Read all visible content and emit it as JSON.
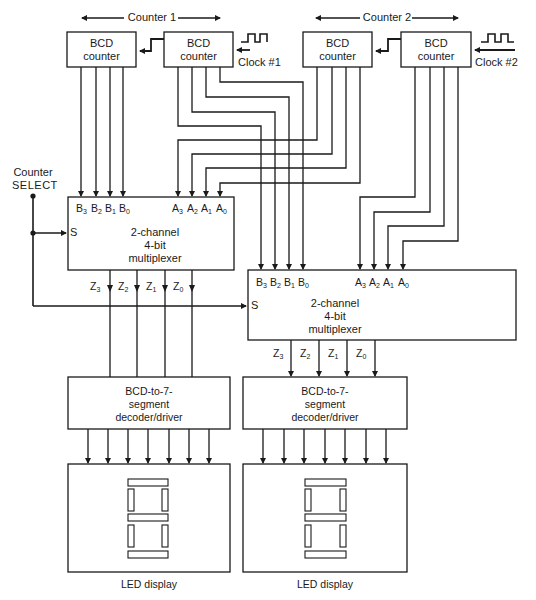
{
  "figure": {
    "counter1_group_label": "Counter 1",
    "counter2_group_label": "Counter 2",
    "counters": [
      {
        "id": "counter1-tens",
        "line1": "BCD",
        "line2": "counter"
      },
      {
        "id": "counter1-units",
        "line1": "BCD",
        "line2": "counter"
      },
      {
        "id": "counter2-tens",
        "line1": "BCD",
        "line2": "counter"
      },
      {
        "id": "counter2-units",
        "line1": "BCD",
        "line2": "counter"
      }
    ],
    "clock1_label": "Clock #1",
    "clock2_label": "Clock #2",
    "select": {
      "line1": "Counter",
      "line2": "SELECT",
      "pin": "S"
    },
    "mux": {
      "line1": "2-channel",
      "line2": "4-bit",
      "line3": "multiplexer",
      "b_inputs": [
        "B",
        "B",
        "B",
        "B"
      ],
      "b_subs": [
        "3",
        "2",
        "1",
        "0"
      ],
      "a_inputs": [
        "A",
        "A",
        "A",
        "A"
      ],
      "a_subs": [
        "3",
        "2",
        "1",
        "0"
      ],
      "outputs": [
        "Z",
        "Z",
        "Z",
        "Z"
      ],
      "output_subs": [
        "3",
        "2",
        "1",
        "0"
      ]
    },
    "decoder": {
      "line1": "BCD-to-7-",
      "line2": "segment",
      "line3": "decoder/driver"
    },
    "display_label": "LED display",
    "stroke_color": "#1a1a1a"
  }
}
